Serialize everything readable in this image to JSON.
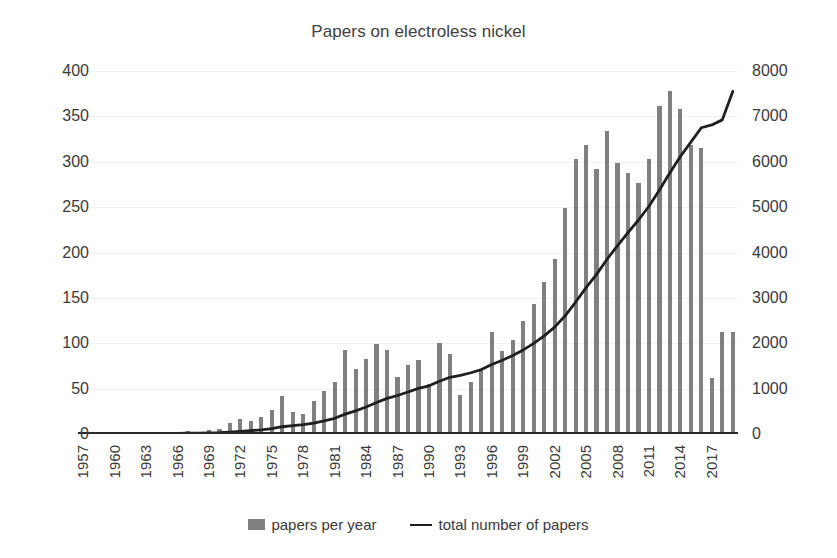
{
  "chart_data": {
    "type": "bar",
    "title": "Papers on electroless nickel",
    "xlabel": "",
    "ylabel": "",
    "ylim": [
      0,
      400
    ],
    "y2lim": [
      0,
      8000
    ],
    "grid": true,
    "legend_position": "bottom",
    "y_ticks": [
      "0",
      "50",
      "100",
      "150",
      "200",
      "250",
      "300",
      "350",
      "400"
    ],
    "y2_ticks": [
      "0",
      "1000",
      "2000",
      "3000",
      "4000",
      "5000",
      "6000",
      "7000",
      "8000"
    ],
    "x_tick_labels": [
      "1957",
      "1960",
      "1963",
      "1966",
      "1969",
      "1972",
      "1975",
      "1978",
      "1981",
      "1984",
      "1987",
      "1990",
      "1993",
      "1996",
      "1999",
      "2002",
      "2005",
      "2008",
      "2011",
      "2014",
      "2017"
    ],
    "x_tick_step": 3,
    "x": [
      1957,
      1958,
      1959,
      1960,
      1961,
      1962,
      1963,
      1964,
      1965,
      1966,
      1967,
      1968,
      1969,
      1970,
      1971,
      1972,
      1973,
      1974,
      1975,
      1976,
      1977,
      1978,
      1979,
      1980,
      1981,
      1982,
      1983,
      1984,
      1985,
      1986,
      1987,
      1988,
      1989,
      1990,
      1991,
      1992,
      1993,
      1994,
      1995,
      1996,
      1997,
      1998,
      1999,
      2000,
      2001,
      2002,
      2003,
      2004,
      2005,
      2006,
      2007,
      2008,
      2009,
      2010,
      2011,
      2012,
      2013,
      2014,
      2015,
      2016,
      2017,
      2018,
      2019
    ],
    "series": [
      {
        "name": "papers per year",
        "type": "bar",
        "axis": "left",
        "color": "#808080",
        "values": [
          1,
          1,
          1,
          1,
          2,
          1,
          2,
          2,
          2,
          2,
          3,
          2,
          4,
          6,
          12,
          17,
          14,
          19,
          26,
          42,
          24,
          22,
          36,
          47,
          57,
          93,
          72,
          83,
          99,
          93,
          63,
          76,
          82,
          55,
          100,
          88,
          43,
          57,
          70,
          112,
          92,
          104,
          125,
          143,
          167,
          193,
          249,
          303,
          318,
          292,
          334,
          299,
          288,
          277,
          303,
          361,
          378,
          358,
          318,
          315,
          62,
          112,
          112
        ]
      },
      {
        "name": "total number of papers",
        "type": "line",
        "axis": "right",
        "color": "#1f1f1f",
        "values": [
          1,
          2,
          3,
          4,
          6,
          7,
          9,
          11,
          13,
          15,
          18,
          20,
          24,
          30,
          42,
          59,
          73,
          92,
          118,
          160,
          184,
          206,
          242,
          289,
          346,
          439,
          511,
          594,
          693,
          786,
          849,
          925,
          1007,
          1062,
          1162,
          1250,
          1293,
          1350,
          1420,
          1532,
          1624,
          1728,
          1853,
          1996,
          2163,
          2356,
          2605,
          2908,
          3226,
          3518,
          3852,
          4151,
          4439,
          4716,
          5019,
          5380,
          5758,
          6116,
          6434,
          6749,
          6811,
          6923,
          7550
        ]
      }
    ]
  },
  "legend": {
    "items": [
      {
        "label": "papers per year",
        "marker": "bar",
        "color": "#808080"
      },
      {
        "label": "total number of papers",
        "marker": "line",
        "color": "#1f1f1f"
      }
    ]
  }
}
